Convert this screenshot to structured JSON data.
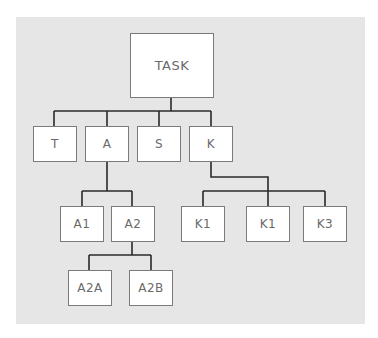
{
  "diagram": {
    "type": "hierarchy",
    "colors": {
      "background": "#e6e6e6",
      "node_fill": "#ffffff",
      "node_border": "#7a7a7a",
      "connector": "#2a2a2a",
      "text": "#6a6a6a"
    },
    "root": {
      "label": "TASK"
    },
    "level1": [
      {
        "label": "T"
      },
      {
        "label": "A"
      },
      {
        "label": "S"
      },
      {
        "label": "K"
      }
    ],
    "a_children": [
      {
        "label": "A1"
      },
      {
        "label": "A2"
      }
    ],
    "a2_children": [
      {
        "label": "A2A"
      },
      {
        "label": "A2B"
      }
    ],
    "k_children": [
      {
        "label": "K1"
      },
      {
        "label": "K1"
      },
      {
        "label": "K3"
      }
    ]
  }
}
